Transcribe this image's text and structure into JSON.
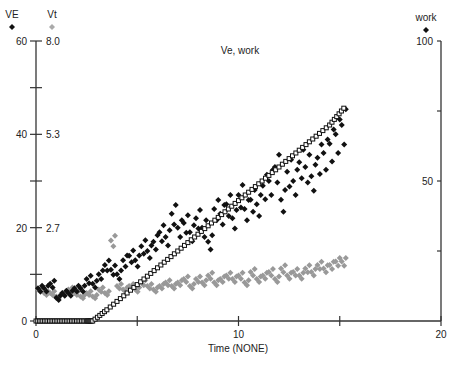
{
  "chart_data": {
    "type": "scatter",
    "title": "Ve, work",
    "xlabel": "Time (NONE)",
    "xlim": [
      0,
      20
    ],
    "x_ticks": [
      0,
      5,
      10,
      15,
      20
    ],
    "x_tick_labels": [
      "0",
      "",
      "10",
      "",
      "20"
    ],
    "axes": {
      "left_primary": {
        "label": "VE",
        "marker": "black-diamond",
        "range": [
          0,
          60
        ],
        "tick_labels": [
          "0",
          "20",
          "40",
          "60"
        ]
      },
      "left_secondary": {
        "label": "Vt",
        "marker": "gray-diamond",
        "range": [
          0,
          8.0
        ],
        "tick_labels": [
          "2.7",
          "5.3",
          "8.0"
        ]
      },
      "right": {
        "label": "work",
        "marker": "black-diamond",
        "range": [
          0,
          100
        ],
        "tick_labels": [
          "50",
          "100"
        ]
      }
    },
    "grid": false,
    "series": [
      {
        "name": "work",
        "axis": "right",
        "color": "#111111",
        "style": "open-square-line",
        "x": [
          0,
          0.5,
          1.0,
          1.5,
          2.0,
          2.5,
          2.8,
          3.5,
          4.5,
          5.5,
          6.5,
          7.5,
          8.5,
          9.5,
          10.5,
          11.5,
          12.5,
          13.5,
          14.5,
          15.2
        ],
        "values": [
          0,
          0,
          0,
          0,
          0,
          0,
          0,
          4,
          10,
          16,
          22,
          28,
          34,
          40,
          46,
          52,
          58,
          64,
          70,
          76
        ]
      },
      {
        "name": "VE",
        "axis": "left_primary",
        "color": "#111111",
        "x": [
          0.1,
          0.4,
          0.7,
          1.0,
          1.3,
          1.6,
          1.9,
          2.2,
          2.5,
          2.8,
          3.1,
          3.4,
          3.7,
          4.0,
          4.3,
          4.6,
          4.9,
          5.2,
          5.5,
          5.8,
          6.1,
          6.4,
          6.7,
          7.0,
          7.3,
          7.6,
          7.9,
          8.2,
          8.5,
          8.8,
          9.1,
          9.4,
          9.7,
          10.0,
          10.3,
          10.6,
          10.9,
          11.2,
          11.5,
          11.8,
          12.1,
          12.4,
          12.7,
          13.0,
          13.3,
          13.6,
          13.9,
          14.2,
          14.5,
          14.8,
          15.1
        ],
        "values": [
          7,
          7,
          8,
          5,
          6,
          6,
          7,
          7,
          9,
          8,
          10,
          12,
          11,
          10,
          13,
          14,
          13,
          16,
          15,
          17,
          19,
          18,
          23,
          20,
          21,
          19,
          22,
          20,
          17,
          24,
          23,
          25,
          22,
          27,
          24,
          26,
          25,
          29,
          30,
          33,
          26,
          32,
          30,
          34,
          33,
          31,
          35,
          36,
          38,
          40,
          42
        ]
      },
      {
        "name": "Vt",
        "axis": "left_secondary",
        "color": "#999999",
        "x": [
          0.1,
          0.4,
          0.7,
          1.0,
          1.3,
          1.6,
          1.9,
          2.2,
          2.5,
          2.8,
          3.1,
          3.4,
          3.7,
          4.0,
          4.3,
          4.6,
          4.9,
          5.2,
          5.5,
          5.8,
          6.1,
          6.4,
          6.7,
          7.0,
          7.3,
          7.6,
          7.9,
          8.2,
          8.5,
          8.8,
          9.1,
          9.4,
          9.7,
          10.0,
          10.3,
          10.6,
          10.9,
          11.2,
          11.5,
          11.8,
          12.1,
          12.4,
          12.7,
          13.0,
          13.3,
          13.6,
          13.9,
          14.2,
          14.5,
          14.8,
          15.1
        ],
        "values": [
          0.9,
          0.8,
          0.8,
          0.7,
          0.8,
          0.9,
          0.8,
          0.7,
          0.8,
          0.7,
          0.9,
          0.8,
          2.3,
          1.0,
          0.9,
          1.0,
          0.9,
          1.1,
          1.0,
          0.9,
          1.0,
          1.1,
          1.0,
          1.1,
          1.2,
          1.0,
          1.2,
          1.1,
          1.3,
          1.1,
          1.2,
          1.3,
          1.2,
          1.3,
          1.1,
          1.4,
          1.2,
          1.3,
          1.4,
          1.2,
          1.5,
          1.3,
          1.4,
          1.3,
          1.5,
          1.4,
          1.6,
          1.5,
          1.6,
          1.7,
          1.7
        ]
      }
    ]
  }
}
